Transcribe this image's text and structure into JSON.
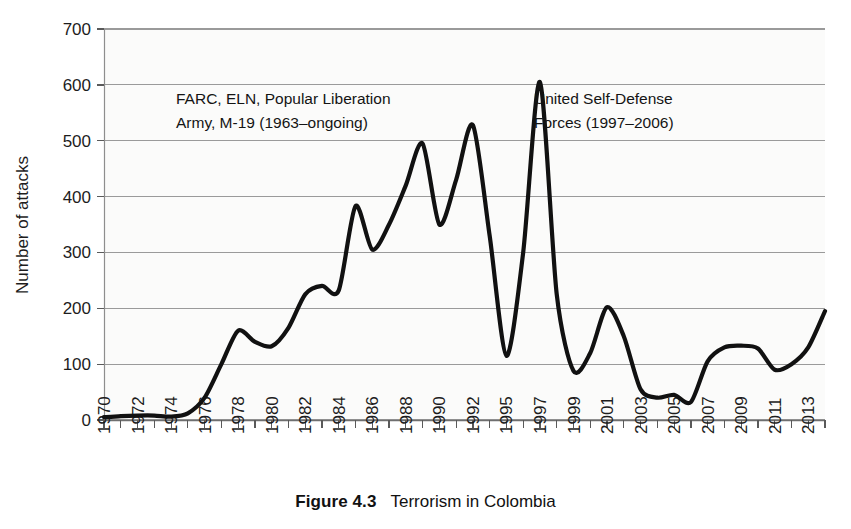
{
  "figure": {
    "caption_label": "Figure 4.3",
    "caption_title": "Terrorism in Colombia"
  },
  "annotations": [
    {
      "name": "farc-annotation",
      "line1": "FARC, ELN, Popular Liberation",
      "line2": "Army, M-19 (1963–ongoing)"
    },
    {
      "name": "auc-annotation",
      "line1": "United Self-Defense",
      "line2": "Forces (1997–2006)"
    }
  ],
  "chart_data": {
    "type": "line",
    "title": "Terrorism in Colombia",
    "xlabel": "",
    "ylabel": "Number of attacks",
    "ylim": [
      0,
      700
    ],
    "yticks": [
      0,
      100,
      200,
      300,
      400,
      500,
      600,
      700
    ],
    "grid": true,
    "legend": "none",
    "line_color": "#111111",
    "gridline_color": "#9a9a9a",
    "plot_background": "#fbfbfa",
    "x": [
      "1970",
      "1971",
      "1972",
      "1973",
      "1974",
      "1975",
      "1976",
      "1977",
      "1978",
      "1979",
      "1980",
      "1981",
      "1982",
      "1983",
      "1984",
      "1985",
      "1986",
      "1987",
      "1988",
      "1989",
      "1990",
      "1991",
      "1992",
      "1994",
      "1995",
      "1996",
      "1997",
      "1998",
      "1999",
      "2000",
      "2001",
      "2002",
      "2003",
      "2004",
      "2005",
      "2006",
      "2007",
      "2008",
      "2009",
      "2010",
      "2011",
      "2012",
      "2013",
      "2014"
    ],
    "xtick_labels": [
      "1970",
      "1972",
      "1974",
      "1976",
      "1978",
      "1980",
      "1982",
      "1984",
      "1986",
      "1988",
      "1990",
      "1992",
      "1995",
      "1997",
      "1999",
      "2001",
      "2003",
      "2005",
      "2007",
      "2009",
      "2011",
      "2013"
    ],
    "values": [
      5,
      7,
      8,
      8,
      6,
      12,
      40,
      100,
      160,
      140,
      132,
      165,
      225,
      240,
      232,
      383,
      305,
      350,
      420,
      495,
      350,
      430,
      528,
      330,
      115,
      300,
      605,
      225,
      88,
      120,
      202,
      150,
      55,
      40,
      45,
      32,
      105,
      130,
      133,
      128,
      90,
      100,
      130,
      195
    ]
  }
}
